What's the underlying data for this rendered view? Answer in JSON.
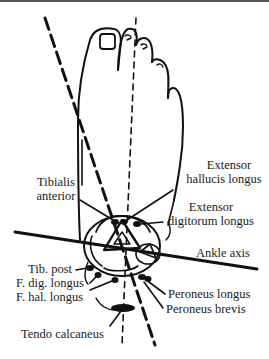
{
  "figure": {
    "axes": {
      "ankle_axis_label": "Ankle axis"
    },
    "labels": {
      "extensor_hallucis_longus": [
        "Extensor",
        "hallucis longus"
      ],
      "tibialis_anterior": [
        "Tibialis",
        "anterior"
      ],
      "extensor_digitorum_longus": [
        "Extensor",
        "digitorum longus"
      ],
      "ankle_axis": "Ankle axis",
      "tib_post": "Tib. post",
      "f_dig_longus": "F. dig. longus",
      "f_hal_longus": "F. hal. longus",
      "peroneus_longus": "Peroneus longus",
      "peroneus_brevis": "Peroneus brevis",
      "tendo_calcaneus": "Tendo calcaneus"
    },
    "colors": {
      "ink": "#111111",
      "background": "#ffffff"
    }
  }
}
